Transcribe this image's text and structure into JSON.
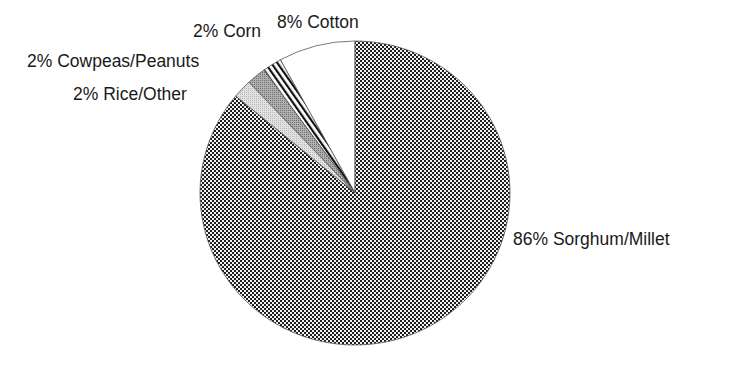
{
  "chart_data": {
    "type": "pie",
    "title": "",
    "start_angle_deg": 0,
    "direction": "counterclockwise",
    "slices": [
      {
        "label": "Cotton",
        "value": 8,
        "text": "8% Cotton",
        "fill": "white"
      },
      {
        "label": "Corn",
        "value": 2,
        "text": "2% Corn",
        "fill": "diagonal-stripes"
      },
      {
        "label": "Cowpeas/Peanuts",
        "value": 2,
        "text": "2% Cowpeas/Peanuts",
        "fill": "medium-gray"
      },
      {
        "label": "Rice/Other",
        "value": 2,
        "text": "2% Rice/Other",
        "fill": "light-gray"
      },
      {
        "label": "Sorghum/Millet",
        "value": 86,
        "text": "86% Sorghum/Millet",
        "fill": "checkerboard"
      }
    ],
    "categories": [
      "Cotton",
      "Corn",
      "Cowpeas/Peanuts",
      "Rice/Other",
      "Sorghum/Millet"
    ],
    "values": [
      8,
      2,
      2,
      2,
      86
    ],
    "legend": "none (direct labels)"
  },
  "labels": {
    "cotton": "8% Cotton",
    "corn": "2% Corn",
    "cowpeas": "2% Cowpeas/Peanuts",
    "rice": "2% Rice/Other",
    "sorghum": "86% Sorghum/Millet"
  },
  "colors": {
    "outline": "#555555",
    "checker_dark": "#1e1e1e",
    "checker_light": "#f2f2f2",
    "stripe_dark": "#111111",
    "medium_gray": "#9a9a9a",
    "light_gray": "#d4d4d4",
    "text": "#1a1a1a"
  }
}
